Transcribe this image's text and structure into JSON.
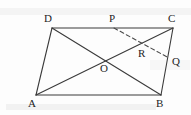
{
  "figure": {
    "kind": "geometry-diagram",
    "shape": "parallelogram",
    "canvas": {
      "width": 191,
      "height": 115
    },
    "colors": {
      "background": "#fdfdfd",
      "stroke": "#3a3a3a",
      "dashed_stroke": "#4a4a4a",
      "label": "#1d1d1d",
      "smudge": "#c9c9c9"
    },
    "stroke_width": 1.1,
    "dash_pattern": "4,3"
  },
  "points": {
    "A": {
      "label": "A",
      "x": 36,
      "y": 95,
      "label_x": 28,
      "label_y": 98
    },
    "B": {
      "label": "B",
      "x": 161,
      "y": 95,
      "label_x": 156,
      "label_y": 98
    },
    "C": {
      "label": "C",
      "x": 173,
      "y": 28,
      "label_x": 168,
      "label_y": 13
    },
    "D": {
      "label": "D",
      "x": 52,
      "y": 28,
      "label_x": 44,
      "label_y": 13
    },
    "O": {
      "label": "O",
      "x": 104,
      "y": 60,
      "label_x": 100,
      "label_y": 63
    },
    "P": {
      "label": "P",
      "x": 114,
      "y": 28,
      "label_x": 109,
      "label_y": 13
    },
    "Q": {
      "label": "Q",
      "x": 169,
      "y": 58,
      "label_x": 172,
      "label_y": 56
    },
    "R": {
      "label": "R",
      "x": 143,
      "y": 45,
      "label_x": 138,
      "label_y": 48
    }
  },
  "segments": {
    "side_DC": {
      "name": "DC",
      "from": "D",
      "to": "C",
      "style": "solid"
    },
    "side_AB": {
      "name": "AB",
      "from": "A",
      "to": "B",
      "style": "solid"
    },
    "side_AD": {
      "name": "AD",
      "from": "A",
      "to": "D",
      "style": "solid"
    },
    "side_BC": {
      "name": "BC",
      "from": "B",
      "to": "C",
      "style": "solid"
    },
    "diag_AC": {
      "name": "AC",
      "from": "A",
      "to": "C",
      "style": "solid"
    },
    "diag_DB": {
      "name": "DB",
      "from": "D",
      "to": "B",
      "style": "solid"
    },
    "line_PQ": {
      "name": "PQ",
      "from": "P",
      "to": "Q",
      "style": "dashed"
    }
  },
  "labels_order": [
    "D",
    "P",
    "C",
    "R",
    "Q",
    "O",
    "A",
    "B"
  ]
}
